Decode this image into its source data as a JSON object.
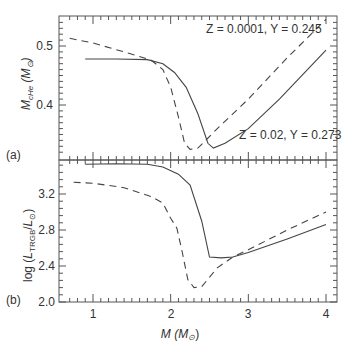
{
  "chart_data": [
    {
      "panel": "(a)",
      "type": "line",
      "title": "",
      "xlabel": "M (M⊙)",
      "ylabel": "M_cHe (M⊙)",
      "xlim": [
        0.7,
        4.1
      ],
      "ylim": [
        0.31,
        0.55
      ],
      "yticks": [
        0.4,
        0.5
      ],
      "grid": false,
      "series": [
        {
          "name": "Z=0.02, Y=0.273",
          "style": "solid",
          "x": [
            0.9,
            1.3,
            1.7,
            1.9,
            2.05,
            2.2,
            2.35,
            2.48,
            2.55,
            2.7,
            3.0,
            3.4,
            4.0
          ],
          "y": [
            0.478,
            0.478,
            0.477,
            0.47,
            0.455,
            0.43,
            0.385,
            0.335,
            0.327,
            0.335,
            0.36,
            0.41,
            0.493
          ]
        },
        {
          "name": "Z=0.0001, Y=0.245",
          "style": "dashed",
          "x": [
            0.7,
            1.0,
            1.4,
            1.75,
            1.9,
            2.0,
            2.1,
            2.18,
            2.25,
            2.35,
            2.6,
            3.0,
            3.5,
            4.0
          ],
          "y": [
            0.513,
            0.505,
            0.49,
            0.476,
            0.46,
            0.43,
            0.38,
            0.335,
            0.325,
            0.327,
            0.36,
            0.41,
            0.48,
            0.545
          ]
        }
      ],
      "annotations": [
        "Z = 0.0001, Y = 0.245",
        "Z = 0.02, Y = 0.273"
      ]
    },
    {
      "panel": "(b)",
      "type": "line",
      "title": "",
      "xlabel": "M (M⊙)",
      "ylabel": "log (L_TRGB/L⊙)",
      "xlim": [
        0.7,
        4.1
      ],
      "ylim": [
        2.0,
        3.6
      ],
      "xticks": [
        1,
        2,
        3,
        4
      ],
      "yticks": [
        2.0,
        2.4,
        2.8,
        3.2
      ],
      "grid": false,
      "series": [
        {
          "name": "Z=0.02, Y=0.273",
          "style": "solid",
          "x": [
            0.9,
            1.3,
            1.7,
            1.9,
            2.1,
            2.25,
            2.4,
            2.5,
            2.65,
            2.8,
            3.0,
            3.5,
            4.0
          ],
          "y": [
            3.53,
            3.535,
            3.53,
            3.5,
            3.42,
            3.3,
            2.9,
            2.5,
            2.49,
            2.5,
            2.55,
            2.7,
            2.86
          ]
        },
        {
          "name": "Z=0.0001, Y=0.245",
          "style": "dashed",
          "x": [
            0.75,
            1.0,
            1.4,
            1.75,
            1.9,
            2.0,
            2.08,
            2.15,
            2.22,
            2.3,
            2.4,
            2.6,
            2.8,
            3.0,
            3.5,
            4.0
          ],
          "y": [
            3.33,
            3.32,
            3.27,
            3.17,
            3.1,
            2.93,
            2.82,
            2.55,
            2.25,
            2.16,
            2.17,
            2.38,
            2.5,
            2.58,
            2.8,
            3.0
          ]
        }
      ]
    }
  ],
  "labels": {
    "panel_a": "(a)",
    "panel_b": "(b)",
    "annot_low_z": "Z = 0.0001, Y = 0.245",
    "annot_high_z": "Z = 0.02, Y = 0.273",
    "xaxis_title": "M (M⊙)",
    "ytick_a": [
      "0.5",
      "0.4"
    ],
    "ytick_b": [
      "3.2",
      "2.8",
      "2.4",
      "2.0"
    ],
    "xtick": [
      "1",
      "2",
      "3",
      "4"
    ]
  }
}
